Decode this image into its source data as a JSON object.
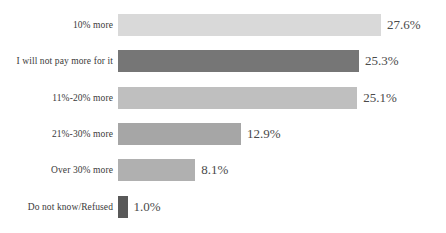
{
  "chart_data": {
    "type": "bar",
    "orientation": "horizontal",
    "title": "",
    "subtitle": "",
    "xlabel": "",
    "ylabel": "",
    "grid": false,
    "legend": "none",
    "xlim": [
      0,
      27.6
    ],
    "value_suffix": "%",
    "categories": [
      "10% more",
      "I will not pay more for it",
      "11%-20% more",
      "21%-30% more",
      "Over 30% more",
      "Do not know/Refused"
    ],
    "values": [
      27.6,
      25.3,
      25.1,
      12.9,
      8.1,
      1.0
    ],
    "value_labels": [
      "27.6%",
      "25.3%",
      "25.1%",
      "12.9%",
      "8.1%",
      "1.0%"
    ],
    "bar_colors": [
      "#d9d9d9",
      "#767676",
      "#bfbfbf",
      "#a6a6a6",
      "#b0b0b0",
      "#595959"
    ]
  }
}
